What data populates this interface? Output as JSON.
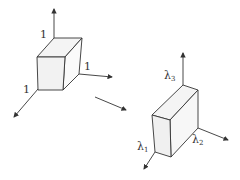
{
  "diagram": {
    "unit_cube": {
      "labels": {
        "top": "1",
        "right": "1",
        "front": "1"
      }
    },
    "transform_arrow": "→",
    "scaled_box": {
      "labels": [
        {
          "base": "λ",
          "sub": "1"
        },
        {
          "base": "λ",
          "sub": "2"
        },
        {
          "base": "λ",
          "sub": "3"
        }
      ]
    },
    "colors": {
      "stroke": "#333333",
      "face": "#f2f2f2",
      "face_dark": "#e8e8e8"
    }
  }
}
